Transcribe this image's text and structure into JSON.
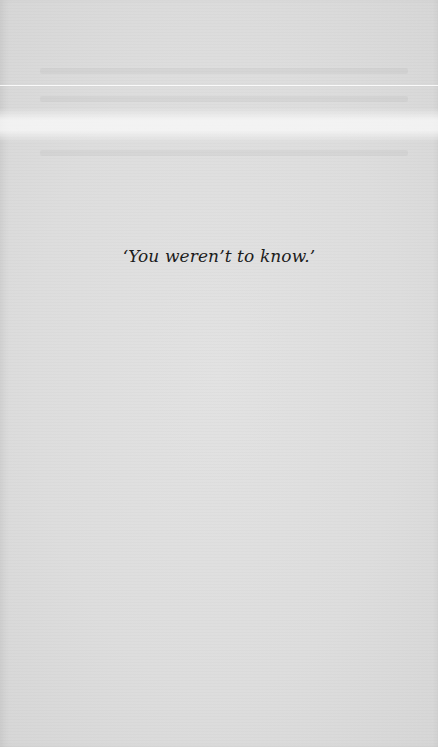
{
  "page": {
    "background_color": "#dedede",
    "text_color": "#1c1c1c",
    "body": {
      "quote": "‘You weren’t to know.’"
    }
  }
}
